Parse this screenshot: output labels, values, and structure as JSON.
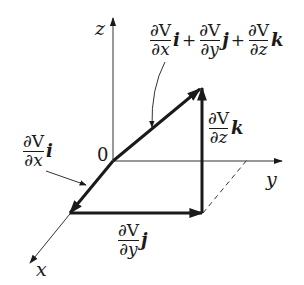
{
  "diagram": {
    "origin_label": "0",
    "axes": [
      {
        "name": "x",
        "label": "x"
      },
      {
        "name": "y",
        "label": "y"
      },
      {
        "name": "z",
        "label": "z"
      }
    ],
    "partial_symbol": "∂",
    "function_symbol": "V",
    "components": {
      "x": {
        "numerator": "∂V",
        "denominator": "∂x",
        "unit_vector": "i"
      },
      "y": {
        "numerator": "∂V",
        "denominator": "∂y",
        "unit_vector": "j"
      },
      "z": {
        "numerator": "∂V",
        "denominator": "∂z",
        "unit_vector": "k"
      }
    },
    "resultant": {
      "terms": [
        {
          "numerator": "∂V",
          "denominator": "∂x",
          "unit_vector": "i"
        },
        {
          "numerator": "∂V",
          "denominator": "∂y",
          "unit_vector": "j"
        },
        {
          "numerator": "∂V",
          "denominator": "∂z",
          "unit_vector": "k"
        }
      ],
      "operator": "+"
    },
    "colors": {
      "ink": "#1a1a1a",
      "axis": "#333333",
      "background": "#ffffff"
    }
  }
}
